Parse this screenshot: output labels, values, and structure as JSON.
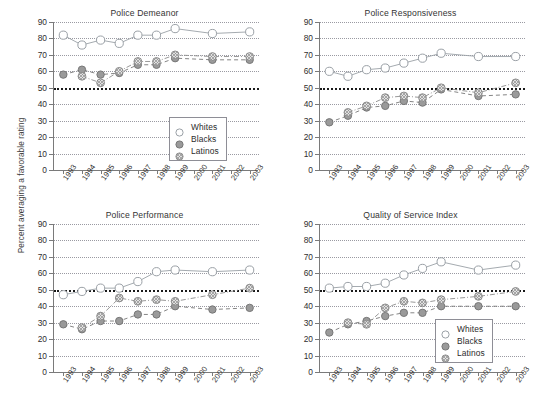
{
  "figure": {
    "ylabel": "Percent averaging a favorable rating",
    "years": [
      "1993",
      "1994",
      "1995",
      "1996",
      "1997",
      "1998",
      "1999",
      "2000",
      "2001",
      "2002",
      "2003"
    ],
    "yticks": [
      0,
      10,
      20,
      30,
      40,
      50,
      60,
      70,
      80,
      90
    ],
    "reference_line": 50,
    "legend": {
      "entries": [
        {
          "label": "Whites",
          "marker": "open-circle-icon",
          "color": "#FFFFFF",
          "edge": "#9aa0a6"
        },
        {
          "label": "Blacks",
          "marker": "filled-circle-icon",
          "color": "#9a9a9a",
          "edge": "#7b7b7b"
        },
        {
          "label": "Latinos",
          "marker": "hatched-circle-icon",
          "color": "#cfcfcf",
          "edge": "#8f8f8f"
        }
      ]
    }
  },
  "chart_data": [
    {
      "type": "line",
      "title": "Police Demeanor",
      "xlabel": "",
      "ylabel": "Percent averaging a favorable rating",
      "ylim": [
        0,
        90
      ],
      "grid": true,
      "legend_position": "bottom-right",
      "categories": [
        "1993",
        "1994",
        "1995",
        "1996",
        "1997",
        "1998",
        "1999",
        "2000",
        "2001",
        "2002",
        "2003"
      ],
      "series": [
        {
          "name": "Whites",
          "values": [
            82,
            76,
            79,
            77,
            82,
            82,
            86,
            null,
            83,
            null,
            84
          ]
        },
        {
          "name": "Blacks",
          "values": [
            58,
            61,
            58,
            59,
            64,
            64,
            68,
            null,
            67,
            null,
            67
          ]
        },
        {
          "name": "Latinos",
          "values": [
            null,
            57,
            53,
            60,
            66,
            66,
            70,
            null,
            69,
            null,
            69
          ]
        }
      ]
    },
    {
      "type": "line",
      "title": "Police Responsiveness",
      "xlabel": "",
      "ylabel": "Percent averaging a favorable rating",
      "ylim": [
        0,
        90
      ],
      "grid": true,
      "legend_position": "none",
      "categories": [
        "1993",
        "1994",
        "1995",
        "1996",
        "1997",
        "1998",
        "1999",
        "2000",
        "2001",
        "2002",
        "2003"
      ],
      "series": [
        {
          "name": "Whites",
          "values": [
            60,
            57,
            61,
            62,
            65,
            68,
            71,
            null,
            69,
            null,
            69
          ]
        },
        {
          "name": "Blacks",
          "values": [
            29,
            33,
            38,
            39,
            42,
            41,
            49,
            null,
            45,
            null,
            46
          ]
        },
        {
          "name": "Latinos",
          "values": [
            null,
            35,
            39,
            44,
            45,
            44,
            50,
            null,
            47,
            null,
            53
          ]
        }
      ]
    },
    {
      "type": "line",
      "title": "Police Performance",
      "xlabel": "",
      "ylabel": "Percent averaging a favorable rating",
      "ylim": [
        0,
        90
      ],
      "grid": true,
      "legend_position": "none",
      "categories": [
        "1993",
        "1994",
        "1995",
        "1996",
        "1997",
        "1998",
        "1999",
        "2000",
        "2001",
        "2002",
        "2003"
      ],
      "series": [
        {
          "name": "Whites",
          "values": [
            47,
            49,
            51,
            51,
            55,
            61,
            62,
            null,
            61,
            null,
            62
          ]
        },
        {
          "name": "Blacks",
          "values": [
            29,
            26,
            31,
            31,
            35,
            35,
            40,
            null,
            38,
            null,
            39
          ]
        },
        {
          "name": "Latinos",
          "values": [
            null,
            27,
            34,
            45,
            43,
            44,
            43,
            null,
            47,
            null,
            51
          ]
        }
      ]
    },
    {
      "type": "line",
      "title": "Quality of Service Index",
      "xlabel": "",
      "ylabel": "Percent averaging a favorable rating",
      "ylim": [
        0,
        90
      ],
      "grid": true,
      "legend_position": "bottom-right",
      "categories": [
        "1993",
        "1994",
        "1995",
        "1996",
        "1997",
        "1998",
        "1999",
        "2000",
        "2001",
        "2002",
        "2003"
      ],
      "series": [
        {
          "name": "Whites",
          "values": [
            51,
            52,
            52,
            54,
            59,
            63,
            67,
            null,
            62,
            null,
            65
          ]
        },
        {
          "name": "Blacks",
          "values": [
            24,
            29,
            31,
            34,
            36,
            36,
            40,
            null,
            40,
            null,
            40
          ]
        },
        {
          "name": "Latinos",
          "values": [
            null,
            30,
            29,
            39,
            43,
            42,
            44,
            null,
            46,
            null,
            49
          ]
        }
      ]
    }
  ]
}
